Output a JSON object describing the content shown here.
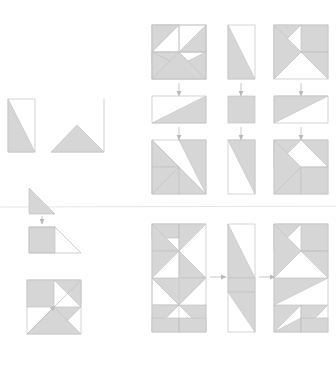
{
  "page": {
    "title": "Quilt Block Half-Square-Triangle Construction Diagram",
    "background_color": "#ffffff",
    "fill_color": "#d6d6d6",
    "stroke_color": "#c3c3c3",
    "arrow_color": "#b9b9b9",
    "divider_color": "#e2e2e2",
    "unit_px": 26
  },
  "chart_data": {
    "type": "diagram",
    "title": "Quilt Block Half-Square-Triangle Construction Diagram",
    "xlabel": "",
    "ylabel": "",
    "grid": false,
    "legend": null,
    "panels": [
      {
        "name": "legend-shapes-top-left",
        "label": "",
        "x": 8,
        "y": 96,
        "shapes": [
          {
            "name": "vertical-rect-lower-left-triangle",
            "kind": "rect-with-triangle",
            "x": 8,
            "y": 99,
            "w": 27,
            "h": 53,
            "fill_polygon": "8,99 8,152 35,152",
            "outline": "8,99 35,99 35,152 8,152"
          },
          {
            "name": "large-right-triangle-with-inner-triangle",
            "kind": "triangle-with-inner",
            "x": 51,
            "y": 99,
            "w": 53,
            "h": 53,
            "outline": "51,152 104,152 104,99",
            "fill_polygon": "51,152 104,152 77,125"
          }
        ]
      },
      {
        "name": "divider-line",
        "label": "",
        "x": 0,
        "y": 207,
        "w": 336,
        "h": 1
      },
      {
        "name": "legend-arrow-step-left",
        "label": "",
        "x": 29,
        "y": 188,
        "shapes": [
          {
            "name": "small-shaded-triangle",
            "kind": "triangle",
            "x": 29,
            "y": 188,
            "w": 26,
            "h": 26,
            "fill_polygon": "29,188 55,214 29,214"
          },
          {
            "name": "down-arrow-small",
            "kind": "arrow-down",
            "x": 42,
            "y": 215,
            "len": 9
          },
          {
            "name": "square-plus-triangle",
            "kind": "square-with-triangle",
            "x": 29,
            "y": 227,
            "w": 52,
            "h": 26,
            "fill_polygon": "29,227 55,227 55,253 29,253",
            "outline": "29,227 55,227 81,253 29,253"
          }
        ]
      },
      {
        "name": "legend-pinwheel-block",
        "label": "",
        "x": 27,
        "y": 280,
        "w": 54,
        "h": 54,
        "shapes": [
          {
            "name": "pinwheel-quadrant-block",
            "kind": "quad-block",
            "x": 27,
            "y": 280,
            "w": 54,
            "h": 54
          },
          {
            "name": "diagonal-arrow-marker",
            "kind": "arrow-diagonal",
            "x": 27,
            "y": 280
          }
        ]
      },
      {
        "name": "top-flow-column-1",
        "label": "",
        "steps": [
          {
            "name": "block-a-top",
            "x": 152,
            "y": 25,
            "w": 54,
            "h": 54,
            "type": "square-pinwheel-a"
          },
          {
            "name": "arrow-down-a1",
            "x": 179,
            "y": 83,
            "len": 14
          },
          {
            "name": "block-a-mid",
            "x": 152,
            "y": 96,
            "w": 54,
            "h": 27,
            "type": "rect-diag-up"
          },
          {
            "name": "arrow-down-a2",
            "x": 179,
            "y": 127,
            "len": 14
          },
          {
            "name": "block-a-bot",
            "x": 152,
            "y": 140,
            "w": 54,
            "h": 54,
            "type": "square-pinwheel-b"
          }
        ]
      },
      {
        "name": "top-flow-column-2",
        "label": "",
        "steps": [
          {
            "name": "block-b-top",
            "x": 228,
            "y": 25,
            "w": 27,
            "h": 54,
            "type": "vrect-diag"
          },
          {
            "name": "arrow-down-b1",
            "x": 241,
            "y": 83,
            "len": 14
          },
          {
            "name": "block-b-mid",
            "x": 228,
            "y": 96,
            "w": 27,
            "h": 27,
            "type": "solid-square"
          },
          {
            "name": "arrow-down-b2",
            "x": 241,
            "y": 127,
            "len": 14
          },
          {
            "name": "block-b-bot",
            "x": 228,
            "y": 140,
            "w": 27,
            "h": 54,
            "type": "vrect-diag-rev"
          }
        ]
      },
      {
        "name": "top-flow-column-3",
        "label": "",
        "steps": [
          {
            "name": "block-c-top",
            "x": 274,
            "y": 25,
            "w": 54,
            "h": 54,
            "type": "square-pinwheel-c"
          },
          {
            "name": "arrow-down-c1",
            "x": 301,
            "y": 83,
            "len": 14
          },
          {
            "name": "block-c-mid",
            "x": 274,
            "y": 96,
            "w": 54,
            "h": 27,
            "type": "rect-diag-down"
          },
          {
            "name": "arrow-down-c2",
            "x": 301,
            "y": 127,
            "len": 14
          },
          {
            "name": "block-c-bot",
            "x": 274,
            "y": 140,
            "w": 54,
            "h": 54,
            "type": "square-pinwheel-d"
          }
        ]
      },
      {
        "name": "bottom-flow-column-1",
        "label": "",
        "x": 152,
        "y": 224,
        "w": 54,
        "h": 108,
        "type": "tall-block-left"
      },
      {
        "name": "bottom-arrow-1",
        "label": "",
        "x": 210,
        "y": 277,
        "len": 16,
        "type": "arrow-right"
      },
      {
        "name": "bottom-flow-column-2",
        "label": "",
        "x": 228,
        "y": 224,
        "w": 27,
        "h": 108,
        "type": "tall-block-mid"
      },
      {
        "name": "bottom-arrow-2",
        "label": "",
        "x": 259,
        "y": 277,
        "len": 16,
        "type": "arrow-right"
      },
      {
        "name": "bottom-flow-column-3",
        "label": "",
        "x": 274,
        "y": 224,
        "w": 54,
        "h": 108,
        "type": "tall-block-right"
      }
    ]
  }
}
